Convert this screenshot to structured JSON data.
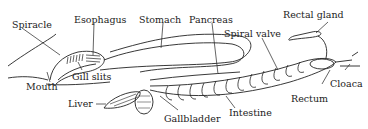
{
  "diagram": {
    "labels": {
      "spiracle": "Spiracle",
      "esophagus": "Esophagus",
      "stomach": "Stomach",
      "pancreas": "Pancreas",
      "rectal_gland": "Rectal gland",
      "spiral_valve": "Spiral valve",
      "gill_slits": "Gill slits",
      "mouth": "Mouth",
      "liver": "Liver",
      "gallbladder": "Gallbladder",
      "intestine": "Intestine",
      "rectum": "Rectum",
      "cloaca": "Cloaca"
    },
    "colors": {
      "ink": "#222222",
      "background": "#ffffff"
    }
  }
}
